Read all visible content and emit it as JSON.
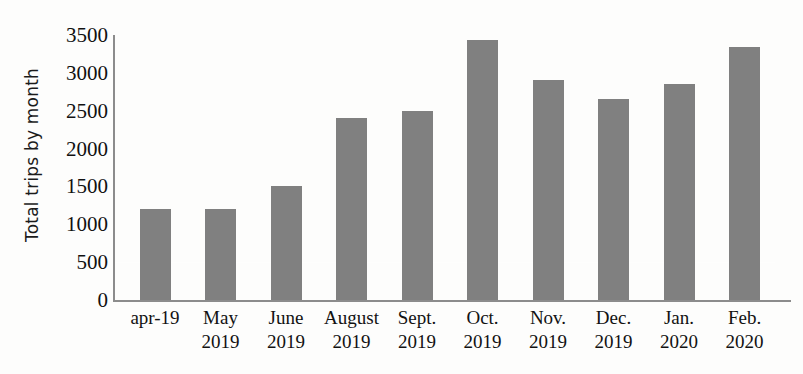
{
  "chart_data": {
    "type": "bar",
    "title": "",
    "xlabel": "",
    "ylabel": "Total trips by month",
    "categories": [
      "apr-19",
      "May 2019",
      "June 2019",
      "August 2019",
      "Sept. 2019",
      "Oct. 2019",
      "Nov. 2019",
      "Dec. 2019",
      "Jan. 2020",
      "Feb. 2020"
    ],
    "category_lines": [
      [
        "apr-19"
      ],
      [
        "May",
        "2019"
      ],
      [
        "June",
        "2019"
      ],
      [
        "August",
        "2019"
      ],
      [
        "Sept.",
        "2019"
      ],
      [
        "Oct.",
        "2019"
      ],
      [
        "Nov.",
        "2019"
      ],
      [
        "Dec.",
        "2019"
      ],
      [
        "Jan.",
        "2020"
      ],
      [
        "Feb.",
        "2020"
      ]
    ],
    "values": [
      1200,
      1200,
      1500,
      2400,
      2500,
      3430,
      2900,
      2650,
      2850,
      3340
    ],
    "ylim": [
      0,
      3500
    ],
    "yticks": [
      0,
      500,
      1000,
      1500,
      2000,
      2500,
      3000,
      3500
    ],
    "ytick_labels": [
      "0",
      "500",
      "1000",
      "1500",
      "2000",
      "2500",
      "3000",
      "3500"
    ],
    "grid": false,
    "legend": null,
    "bar_color": "#808080",
    "axis_color": "#8c8c8c",
    "background_color": "#fdfdfc",
    "text_color": "#111111"
  }
}
